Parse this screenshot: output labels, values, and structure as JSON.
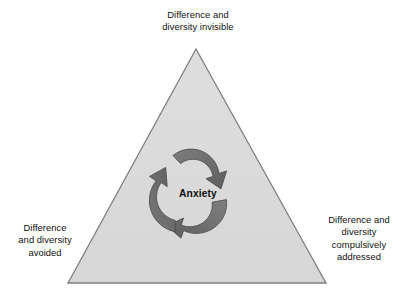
{
  "figure": {
    "type": "cycle-triangle-diagram",
    "background_color": "#ffffff",
    "triangle": {
      "fill_color": "#dcdcdc",
      "stroke_color": "#7d7d7d",
      "apex": {
        "x": 196,
        "y": 49
      },
      "bottom_left": {
        "x": 68,
        "y": 283
      },
      "bottom_right": {
        "x": 326,
        "y": 283
      }
    },
    "cycle": {
      "direction": "clockwise",
      "arrow_count": 3,
      "arrow_fill_color": "#6f6f6f",
      "arrow_stroke_color": "#4a4a4a"
    }
  },
  "labels": {
    "top": "Difference and\ndiversity invisible",
    "bottom_left": "Difference\nand diversity\navoided",
    "bottom_right": "Difference and\ndiversity\ncompulsively\naddressed"
  },
  "center": {
    "text": "Anxiety"
  }
}
